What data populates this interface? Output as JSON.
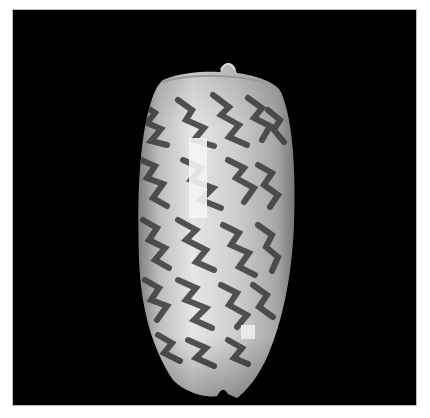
{
  "image": {
    "subject": "olive sea shell (Oliva) with dark zigzag pattern on black background",
    "background_color": "#000000",
    "page_color": "#ffffff",
    "shell_colors": {
      "base": "#c9c9c9",
      "highlight": "#f4f4f4",
      "pattern": "#3a3a3a"
    }
  }
}
